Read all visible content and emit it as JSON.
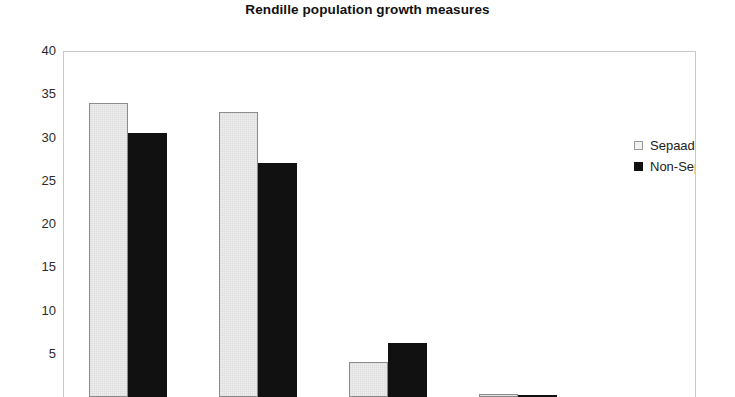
{
  "chart_data": {
    "type": "bar",
    "title": "Rendille population growth measures",
    "xlabel": "",
    "ylabel": "",
    "ylim": [
      0,
      40
    ],
    "yticks": [
      40,
      35,
      30,
      25,
      20,
      15,
      10,
      5
    ],
    "grid": false,
    "legend_position": "top-right",
    "categories": [
      "",
      "",
      "",
      ""
    ],
    "series": [
      {
        "name": "Sepaade",
        "color": "#eeeeee",
        "values": [
          34,
          33,
          4,
          0.3
        ]
      },
      {
        "name": "Non-Sepaade",
        "color": "#111111",
        "values": [
          30.5,
          27,
          6.3,
          0
        ]
      }
    ]
  },
  "legend": {
    "items": [
      {
        "label": "Sepaade",
        "swatch": "light-square-swatch"
      },
      {
        "label": "Non-Sepaade",
        "swatch": "black-square-swatch"
      }
    ]
  }
}
